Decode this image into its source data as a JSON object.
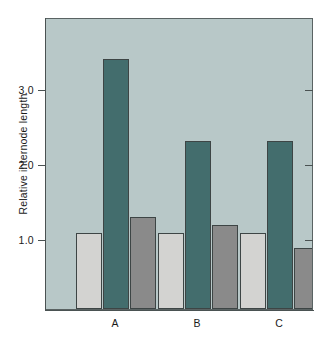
{
  "chart_data": {
    "type": "bar",
    "title": "",
    "xlabel": "",
    "ylabel": "Relative internode length",
    "categories": [
      "A",
      "B",
      "C"
    ],
    "ylim": [
      0,
      3.8
    ],
    "yticks": [
      1.0,
      2.0,
      3.0
    ],
    "ytick_labels": [
      "1.0",
      "2.0",
      "3.0"
    ],
    "grid": false,
    "legend": "none",
    "series": [
      {
        "name": "series-1",
        "color": "#d3d3d1",
        "values": [
          1.0,
          1.0,
          1.0
        ]
      },
      {
        "name": "series-2",
        "color": "#436d6d",
        "values": [
          3.28,
          2.2,
          2.2
        ]
      },
      {
        "name": "series-3",
        "color": "#8a8a8a",
        "values": [
          1.2,
          1.1,
          0.8
        ]
      }
    ]
  },
  "axes": {
    "y_title": "Relative internode length",
    "y_tick_labels": [
      "3.0",
      "2.0",
      "1.0"
    ],
    "x_tick_labels": [
      "A",
      "B",
      "C"
    ]
  },
  "colors": {
    "plot_background": "#b8c8c8",
    "axis": "#4a5252",
    "bar_light": "#d3d3d1",
    "bar_teal": "#436d6d",
    "bar_gray": "#8a8a8a",
    "page_background": "#ffffff"
  }
}
